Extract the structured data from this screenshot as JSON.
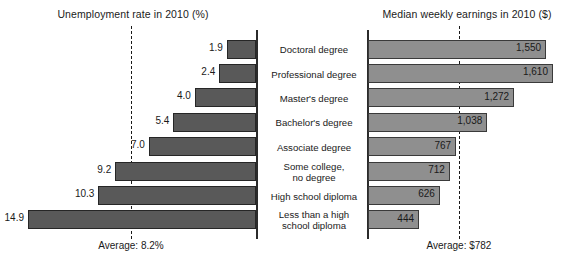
{
  "chart_data": {
    "type": "bar",
    "title": "",
    "grid": false,
    "legend_position": "none",
    "layout": "back-to-back bidirectional bar chart, categories centered between two panels",
    "categories": [
      "Doctoral degree",
      "Professional degree",
      "Master's degree",
      "Bachelor's degree",
      "Associate degree",
      "Some college,\nno degree",
      "High school diploma",
      "Less than a high\nschool diploma"
    ],
    "panels": [
      {
        "name": "unemployment",
        "title": "Unemployment rate in 2010 (%)",
        "xlabel": "",
        "ylabel": "",
        "direction": "left",
        "values": [
          1.9,
          2.4,
          4.0,
          5.4,
          7.0,
          9.2,
          10.3,
          14.9
        ],
        "value_labels": [
          "1.9",
          "2.4",
          "4.0",
          "5.4",
          "7.0",
          "9.2",
          "10.3",
          "14.9"
        ],
        "xlim": [
          0,
          14.9
        ],
        "average": 8.2,
        "average_label": "Average: 8.2%"
      },
      {
        "name": "earnings",
        "title": "Median weekly earnings in 2010 ($)",
        "xlabel": "",
        "ylabel": "",
        "direction": "right",
        "values": [
          1550,
          1610,
          1272,
          1038,
          767,
          712,
          626,
          444
        ],
        "value_labels": [
          "1,550",
          "1,610",
          "1,272",
          "1,038",
          "767",
          "712",
          "626",
          "444"
        ],
        "xlim": [
          0,
          1610
        ],
        "average": 782,
        "average_label": "Average: $782"
      }
    ],
    "colors": {
      "unemployment_bar": "#595959",
      "earnings_bar": "#8f8f8f",
      "bar_border": "#262626",
      "axis": "#2b2b2b",
      "average_line": "#1a1a1a",
      "text": "#1a1a1a",
      "background": "#ffffff"
    }
  }
}
